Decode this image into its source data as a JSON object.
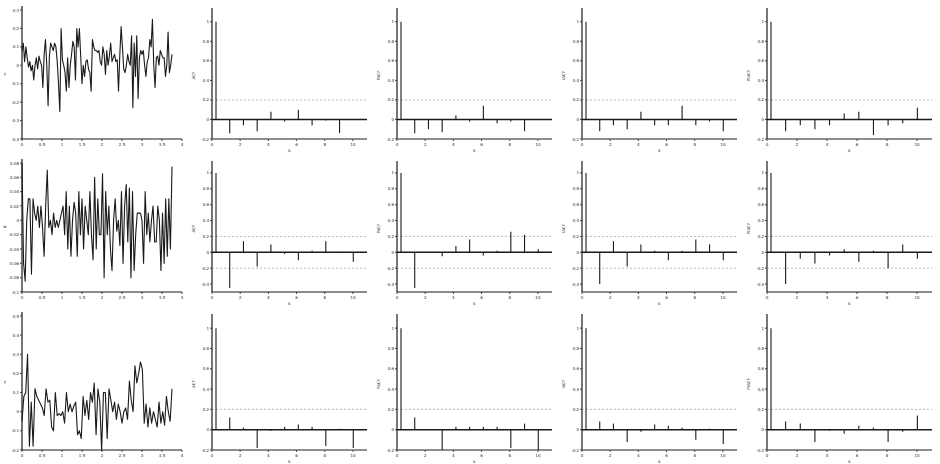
{
  "figure": {
    "rows": 3,
    "cols": 5,
    "background": "#ffffff",
    "line_color": "#1a1a1a",
    "band_color": "#9a9a9a"
  },
  "chart_data": [
    {
      "id": "r1c1",
      "type": "line",
      "row": 0,
      "col": 0,
      "title": "",
      "xlabel": "",
      "ylabel": "y",
      "xlim": [
        0,
        4
      ],
      "ylim": [
        -0.4,
        0.3
      ],
      "xticks": [
        0,
        0.5,
        1,
        1.5,
        2,
        2.5,
        3,
        3.5,
        4
      ],
      "xtick_labels": [
        "0",
        "0.5",
        "1",
        "1.5",
        "2",
        "2.5",
        "3",
        "3.5",
        "4"
      ],
      "yticks": [
        -0.4,
        -0.3,
        -0.2,
        -0.1,
        0,
        0.1,
        0.2,
        0.3
      ],
      "ytick_labels": [
        "-0.4",
        "-0.3",
        "-0.2",
        "-0.1",
        "0",
        "0.1",
        "0.2",
        "0.3"
      ],
      "x_end": 3.75,
      "values": [
        0.08,
        0.12,
        0.02,
        0.1,
        0.04,
        -0.01,
        0.02,
        -0.03,
        0.0,
        -0.08,
        0.0,
        0.04,
        -0.02,
        0.05,
        0.02,
        0.0,
        -0.12,
        0.06,
        0.14,
        0.0,
        -0.22,
        0.05,
        0.12,
        0.1,
        0.08,
        0.12,
        0.1,
        0.02,
        -0.1,
        -0.25,
        0.2,
        0.03,
        0.0,
        -0.04,
        -0.14,
        0.04,
        -0.12,
        0.0,
        0.06,
        0.13,
        0.1,
        -0.08,
        0.2,
        0.1,
        0.2,
        0.05,
        -0.1,
        0.0,
        -0.06,
        0.02,
        0.03,
        -0.02,
        -0.04,
        -0.14,
        0.14,
        0.1,
        0.08,
        0.08,
        0.07,
        0.08,
        0.02,
        0.0,
        0.1,
        0.06,
        -0.05,
        0.08,
        0.0,
        0.05,
        0.12,
        0.02,
        0.04,
        0.06,
        0.02,
        0.03,
        -0.14,
        0.06,
        0.21,
        0.1,
        -0.02,
        -0.04,
        0.0,
        0.06,
        0.02,
        0.0,
        0.16,
        -0.23,
        0.12,
        -0.06,
        0.16,
        -0.18,
        0.04,
        0.08,
        0.06,
        0.08,
        0.0,
        -0.06,
        0.02,
        0.04,
        0.14,
        0.1,
        0.25,
        0.0,
        -0.12,
        0.04,
        0.05,
        0.0,
        0.08,
        0.06,
        0.04,
        0.04,
        -0.06,
        0.0,
        0.18,
        -0.04,
        0.0,
        0.06
      ]
    },
    {
      "id": "r1c2",
      "type": "stem",
      "row": 0,
      "col": 1,
      "title": "",
      "xlabel": "k",
      "ylabel": "ACF",
      "xlim": [
        0,
        11
      ],
      "ylim": [
        -0.2,
        1.1
      ],
      "xticks": [
        0,
        2,
        4,
        6,
        8,
        10
      ],
      "xtick_labels": [
        "0",
        "2",
        "4",
        "6",
        "8",
        "10"
      ],
      "yticks": [
        -0.2,
        0,
        0.2,
        0.4,
        0.6,
        0.8,
        1
      ],
      "ytick_labels": [
        "-0.2",
        "0",
        "0.2",
        "0.4",
        "0.6",
        "0.8",
        "1"
      ],
      "band": 0.2,
      "lags": [
        0,
        1,
        2,
        3,
        4,
        5,
        6,
        7,
        8,
        9,
        10
      ],
      "values": [
        1.0,
        -0.14,
        -0.06,
        -0.12,
        0.08,
        -0.02,
        0.1,
        -0.06,
        -0.01,
        -0.14,
        0.0
      ]
    },
    {
      "id": "r1c3",
      "type": "stem",
      "row": 0,
      "col": 2,
      "title": "",
      "xlabel": "k",
      "ylabel": "PACF",
      "xlim": [
        0,
        11
      ],
      "ylim": [
        -0.2,
        1.1
      ],
      "xticks": [
        0,
        2,
        4,
        6,
        8,
        10
      ],
      "xtick_labels": [
        "0",
        "2",
        "4",
        "6",
        "8",
        "10"
      ],
      "yticks": [
        -0.2,
        0,
        0.2,
        0.4,
        0.6,
        0.8,
        1
      ],
      "ytick_labels": [
        "-0.2",
        "0",
        "0.2",
        "0.4",
        "0.6",
        "0.8",
        "1"
      ],
      "band": 0.2,
      "lags": [
        0,
        1,
        2,
        3,
        4,
        5,
        6,
        7,
        8,
        9,
        10
      ],
      "values": [
        1.0,
        -0.14,
        -0.1,
        -0.13,
        0.04,
        -0.02,
        0.14,
        -0.04,
        -0.02,
        -0.12,
        0.0
      ]
    },
    {
      "id": "r1c4",
      "type": "stem",
      "row": 0,
      "col": 3,
      "title": "",
      "xlabel": "k",
      "ylabel": "IACF",
      "xlim": [
        0,
        11
      ],
      "ylim": [
        -0.2,
        1.1
      ],
      "xticks": [
        0,
        2,
        4,
        6,
        8,
        10
      ],
      "xtick_labels": [
        "0",
        "2",
        "4",
        "6",
        "8",
        "10"
      ],
      "yticks": [
        -0.2,
        0,
        0.2,
        0.4,
        0.6,
        0.8,
        1
      ],
      "ytick_labels": [
        "-0.2",
        "0",
        "0.2",
        "0.4",
        "0.6",
        "0.8",
        "1"
      ],
      "band": 0.2,
      "lags": [
        0,
        1,
        2,
        3,
        4,
        5,
        6,
        7,
        8,
        9,
        10
      ],
      "values": [
        1.0,
        -0.12,
        -0.06,
        -0.1,
        0.08,
        -0.06,
        -0.06,
        0.14,
        -0.06,
        -0.02,
        -0.12
      ]
    },
    {
      "id": "r1c5",
      "type": "stem",
      "row": 0,
      "col": 4,
      "title": "",
      "xlabel": "k",
      "ylabel": "PIACF",
      "xlim": [
        0,
        11
      ],
      "ylim": [
        -0.2,
        1.1
      ],
      "xticks": [
        0,
        2,
        4,
        6,
        8,
        10
      ],
      "xtick_labels": [
        "0",
        "2",
        "4",
        "6",
        "8",
        "10"
      ],
      "yticks": [
        -0.2,
        0,
        0.2,
        0.4,
        0.6,
        0.8,
        1
      ],
      "ytick_labels": [
        "-0.2",
        "0",
        "0.2",
        "0.4",
        "0.6",
        "0.8",
        "1"
      ],
      "band": 0.2,
      "lags": [
        0,
        1,
        2,
        3,
        4,
        5,
        6,
        7,
        8,
        9,
        10
      ],
      "values": [
        1.0,
        -0.12,
        -0.06,
        -0.1,
        -0.06,
        0.06,
        0.08,
        -0.16,
        -0.06,
        -0.04,
        0.12
      ]
    },
    {
      "id": "r2c1",
      "type": "line",
      "row": 1,
      "col": 0,
      "title": "",
      "xlabel": "",
      "ylabel": "w",
      "xlim": [
        0,
        4
      ],
      "ylim": [
        -0.1,
        0.08
      ],
      "xticks": [
        0,
        0.5,
        1,
        1.5,
        2,
        2.5,
        3,
        3.5,
        4
      ],
      "xtick_labels": [
        "0",
        "0.5",
        "1",
        "1.5",
        "2",
        "2.5",
        "3",
        "3.5",
        "4"
      ],
      "yticks": [
        -0.1,
        -0.08,
        -0.06,
        -0.04,
        -0.02,
        0,
        0.02,
        0.04,
        0.06,
        0.08
      ],
      "ytick_labels": [
        "-0.1",
        "-0.08",
        "-0.06",
        "-0.04",
        "-0.02",
        "0",
        "0.02",
        "0.04",
        "0.06",
        "0.08"
      ],
      "x_end": 3.75,
      "values": [
        0.08,
        -0.06,
        -0.085,
        0.0,
        0.03,
        0.03,
        -0.075,
        0.03,
        0.01,
        0.0,
        0.02,
        -0.01,
        0.02,
        -0.01,
        -0.05,
        0.02,
        0.07,
        -0.01,
        0.0,
        -0.02,
        0.01,
        -0.01,
        0.0,
        -0.01,
        0.0,
        0.01,
        0.02,
        -0.02,
        0.04,
        -0.04,
        0.02,
        -0.05,
        0.0,
        0.025,
        0.01,
        -0.05,
        0.04,
        -0.02,
        0.03,
        -0.04,
        0.02,
        0.0,
        -0.02,
        0.04,
        -0.02,
        -0.055,
        0.06,
        -0.04,
        0.03,
        -0.02,
        -0.02,
        0.065,
        -0.08,
        0.04,
        -0.02,
        0.02,
        -0.04,
        -0.07,
        0.0,
        0.03,
        -0.015,
        0.0,
        -0.035,
        0.04,
        -0.06,
        0.02,
        0.05,
        -0.03,
        0.045,
        -0.08,
        0.04,
        -0.07,
        -0.02,
        0.01,
        0.01,
        0.01,
        0.0,
        -0.06,
        0.04,
        -0.02,
        0.01,
        -0.03,
        0.0,
        0.02,
        -0.03,
        -0.03,
        0.02,
        0.0,
        -0.07,
        0.01,
        -0.06,
        0.03,
        -0.05,
        0.03,
        -0.04,
        0.075
      ]
    },
    {
      "id": "r2c2",
      "type": "stem",
      "row": 1,
      "col": 1,
      "title": "",
      "xlabel": "k",
      "ylabel": "ACF",
      "xlim": [
        0,
        11
      ],
      "ylim": [
        -0.5,
        1.1
      ],
      "xticks": [
        0,
        2,
        4,
        6,
        8,
        10
      ],
      "xtick_labels": [
        "0",
        "2",
        "4",
        "6",
        "8",
        "10"
      ],
      "yticks": [
        -0.4,
        -0.2,
        0,
        0.2,
        0.4,
        0.6,
        0.8,
        1
      ],
      "ytick_labels": [
        "-0.4",
        "-0.2",
        "0",
        "0.2",
        "0.4",
        "0.6",
        "0.8",
        "1"
      ],
      "band": 0.2,
      "lags": [
        0,
        1,
        2,
        3,
        4,
        5,
        6,
        7,
        8,
        9,
        10
      ],
      "values": [
        1.0,
        -0.45,
        0.14,
        -0.18,
        0.1,
        -0.02,
        -0.1,
        0.02,
        0.14,
        -0.01,
        -0.12
      ]
    },
    {
      "id": "r2c3",
      "type": "stem",
      "row": 1,
      "col": 2,
      "title": "",
      "xlabel": "k",
      "ylabel": "PACF",
      "xlim": [
        0,
        11
      ],
      "ylim": [
        -0.5,
        1.1
      ],
      "xticks": [
        0,
        2,
        4,
        6,
        8,
        10
      ],
      "xtick_labels": [
        "0",
        "2",
        "4",
        "6",
        "8",
        "10"
      ],
      "yticks": [
        -0.4,
        -0.2,
        0,
        0.2,
        0.4,
        0.6,
        0.8,
        1
      ],
      "ytick_labels": [
        "-0.4",
        "-0.2",
        "0",
        "0.2",
        "0.4",
        "0.6",
        "0.8",
        "1"
      ],
      "band": 0.2,
      "lags": [
        0,
        1,
        2,
        3,
        4,
        5,
        6,
        7,
        8,
        9,
        10
      ],
      "values": [
        1.0,
        -0.45,
        0.0,
        -0.05,
        0.08,
        0.16,
        -0.04,
        0.02,
        0.26,
        0.22,
        0.04
      ]
    },
    {
      "id": "r2c4",
      "type": "stem",
      "row": 1,
      "col": 3,
      "title": "",
      "xlabel": "k",
      "ylabel": "IACF",
      "xlim": [
        0,
        11
      ],
      "ylim": [
        -0.5,
        1.1
      ],
      "xticks": [
        0,
        2,
        4,
        6,
        8,
        10
      ],
      "xtick_labels": [
        "0",
        "2",
        "4",
        "6",
        "8",
        "10"
      ],
      "yticks": [
        -0.4,
        -0.2,
        0,
        0.2,
        0.4,
        0.6,
        0.8,
        1
      ],
      "ytick_labels": [
        "-0.4",
        "-0.2",
        "0",
        "0.2",
        "0.4",
        "0.6",
        "0.8",
        "1"
      ],
      "band": 0.2,
      "lags": [
        0,
        1,
        2,
        3,
        4,
        5,
        6,
        7,
        8,
        9,
        10
      ],
      "values": [
        1.0,
        -0.4,
        0.14,
        -0.18,
        0.1,
        0.02,
        -0.1,
        0.02,
        0.16,
        0.1,
        -0.1
      ]
    },
    {
      "id": "r2c5",
      "type": "stem",
      "row": 1,
      "col": 4,
      "title": "",
      "xlabel": "k",
      "ylabel": "PIACF",
      "xlim": [
        0,
        11
      ],
      "ylim": [
        -0.5,
        1.1
      ],
      "xticks": [
        0,
        2,
        4,
        6,
        8,
        10
      ],
      "xtick_labels": [
        "0",
        "2",
        "4",
        "6",
        "8",
        "10"
      ],
      "yticks": [
        -0.4,
        -0.2,
        0,
        0.2,
        0.4,
        0.6,
        0.8,
        1
      ],
      "ytick_labels": [
        "-0.4",
        "-0.2",
        "0",
        "0.2",
        "0.4",
        "0.6",
        "0.8",
        "1"
      ],
      "band": 0.2,
      "lags": [
        0,
        1,
        2,
        3,
        4,
        5,
        6,
        7,
        8,
        9,
        10
      ],
      "values": [
        1.0,
        -0.4,
        -0.08,
        -0.14,
        -0.04,
        0.04,
        -0.12,
        0.02,
        -0.2,
        0.1,
        -0.08
      ]
    },
    {
      "id": "r3c1",
      "type": "line",
      "row": 2,
      "col": 0,
      "title": "",
      "xlabel": "",
      "ylabel": "y",
      "xlim": [
        0,
        4
      ],
      "ylim": [
        -0.2,
        0.5
      ],
      "xticks": [
        0,
        0.5,
        1,
        1.5,
        2,
        2.5,
        3,
        3.5,
        4
      ],
      "xtick_labels": [
        "0",
        "0.5",
        "1",
        "1.5",
        "2",
        "2.5",
        "3",
        "3.5",
        "4"
      ],
      "yticks": [
        -0.2,
        -0.1,
        0,
        0.1,
        0.2,
        0.3,
        0.4,
        0.5
      ],
      "ytick_labels": [
        "-0.2",
        "-0.1",
        "0",
        "0.1",
        "0.2",
        "0.3",
        "0.4",
        "0.5"
      ],
      "x_end": 3.75,
      "values": [
        -0.05,
        0.08,
        0.1,
        0.3,
        -0.18,
        0.05,
        -0.18,
        0.12,
        0.08,
        0.06,
        0.04,
        0.02,
        -0.02,
        0.12,
        0.05,
        0.06,
        -0.08,
        -0.1,
        0.1,
        -0.02,
        -0.01,
        -0.02,
        0.0,
        -0.06,
        0.1,
        0.0,
        0.04,
        0.0,
        0.03,
        0.05,
        -0.12,
        -0.1,
        -0.14,
        0.08,
        -0.02,
        0.06,
        -0.04,
        0.1,
        0.05,
        0.15,
        -0.12,
        0.12,
        0.05,
        -0.2,
        0.1,
        0.1,
        -0.14,
        0.12,
        0.06,
        0.0,
        0.05,
        -0.04,
        0.04,
        0.0,
        -0.06,
        0.0,
        0.02,
        -0.04,
        0.16,
        0.06,
        0.0,
        0.24,
        0.15,
        0.2,
        0.26,
        0.22,
        -0.06,
        0.04,
        -0.08,
        0.02,
        -0.06,
        0.0,
        -0.04,
        -0.08,
        0.05,
        -0.06,
        0.0,
        -0.07,
        0.08,
        0.0,
        -0.05,
        0.12
      ]
    },
    {
      "id": "r3c2",
      "type": "stem",
      "row": 2,
      "col": 1,
      "title": "",
      "xlabel": "k",
      "ylabel": "ACF",
      "xlim": [
        0,
        11
      ],
      "ylim": [
        -0.2,
        1.1
      ],
      "xticks": [
        0,
        2,
        4,
        6,
        8,
        10
      ],
      "xtick_labels": [
        "0",
        "2",
        "4",
        "6",
        "8",
        "10"
      ],
      "yticks": [
        -0.2,
        0,
        0.2,
        0.4,
        0.6,
        0.8,
        1
      ],
      "ytick_labels": [
        "-0.2",
        "0",
        "0.2",
        "0.4",
        "0.6",
        "0.8",
        "1"
      ],
      "band": 0.2,
      "lags": [
        0,
        1,
        2,
        3,
        4,
        5,
        6,
        7,
        8,
        9,
        10
      ],
      "values": [
        1.0,
        0.12,
        0.02,
        -0.18,
        -0.01,
        0.03,
        0.05,
        0.03,
        -0.16,
        0.01,
        -0.18
      ]
    },
    {
      "id": "r3c3",
      "type": "stem",
      "row": 2,
      "col": 2,
      "title": "",
      "xlabel": "k",
      "ylabel": "PACF",
      "xlim": [
        0,
        11
      ],
      "ylim": [
        -0.2,
        1.1
      ],
      "xticks": [
        0,
        2,
        4,
        6,
        8,
        10
      ],
      "xtick_labels": [
        "0",
        "2",
        "4",
        "6",
        "8",
        "10"
      ],
      "yticks": [
        -0.2,
        0,
        0.2,
        0.4,
        0.6,
        0.8,
        1
      ],
      "ytick_labels": [
        "-0.2",
        "0",
        "0.2",
        "0.4",
        "0.6",
        "0.8",
        "1"
      ],
      "band": 0.2,
      "lags": [
        0,
        1,
        2,
        3,
        4,
        5,
        6,
        7,
        8,
        9,
        10
      ],
      "values": [
        1.0,
        0.12,
        0.0,
        -0.2,
        0.03,
        0.03,
        0.03,
        0.03,
        -0.18,
        0.06,
        -0.2
      ]
    },
    {
      "id": "r3c4",
      "type": "stem",
      "row": 2,
      "col": 3,
      "title": "",
      "xlabel": "k",
      "ylabel": "IACF",
      "xlim": [
        0,
        11
      ],
      "ylim": [
        -0.2,
        1.1
      ],
      "xticks": [
        0,
        2,
        4,
        6,
        8,
        10
      ],
      "xtick_labels": [
        "0",
        "2",
        "4",
        "6",
        "8",
        "10"
      ],
      "yticks": [
        -0.2,
        0,
        0.2,
        0.4,
        0.6,
        0.8,
        1
      ],
      "ytick_labels": [
        "-0.2",
        "0",
        "0.2",
        "0.4",
        "0.6",
        "0.8",
        "1"
      ],
      "band": 0.2,
      "lags": [
        0,
        1,
        2,
        3,
        4,
        5,
        6,
        7,
        8,
        9,
        10
      ],
      "values": [
        1.0,
        0.08,
        0.06,
        -0.12,
        -0.02,
        0.05,
        0.04,
        0.02,
        -0.1,
        0.01,
        -0.14
      ]
    },
    {
      "id": "r3c5",
      "type": "stem",
      "row": 2,
      "col": 4,
      "title": "",
      "xlabel": "k",
      "ylabel": "PIACF",
      "xlim": [
        0,
        11
      ],
      "ylim": [
        -0.2,
        1.1
      ],
      "xticks": [
        0,
        2,
        4,
        6,
        8,
        10
      ],
      "xtick_labels": [
        "0",
        "2",
        "4",
        "6",
        "8",
        "10"
      ],
      "yticks": [
        -0.2,
        0,
        0.2,
        0.4,
        0.6,
        0.8,
        1
      ],
      "ytick_labels": [
        "-0.2",
        "0",
        "0.2",
        "0.4",
        "0.6",
        "0.8",
        "1"
      ],
      "band": 0.2,
      "lags": [
        0,
        1,
        2,
        3,
        4,
        5,
        6,
        7,
        8,
        9,
        10
      ],
      "values": [
        1.0,
        0.08,
        0.06,
        -0.12,
        -0.01,
        -0.04,
        0.04,
        0.02,
        -0.12,
        -0.02,
        0.14
      ]
    }
  ]
}
